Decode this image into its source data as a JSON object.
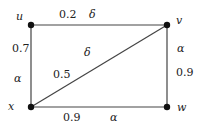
{
  "graph": {
    "nodes": [
      {
        "id": "u",
        "label": "u",
        "x": 31,
        "y": 25
      },
      {
        "id": "v",
        "label": "v",
        "x": 167,
        "y": 25
      },
      {
        "id": "x",
        "label": "x",
        "x": 31,
        "y": 107
      },
      {
        "id": "w",
        "label": "w",
        "x": 167,
        "y": 107
      }
    ],
    "edges": [
      {
        "from": "u",
        "to": "v",
        "weight": "0.2",
        "param": "δ"
      },
      {
        "from": "u",
        "to": "x",
        "weight": "0.7",
        "param": "α"
      },
      {
        "from": "v",
        "to": "w",
        "weight": "0.9",
        "param": "α"
      },
      {
        "from": "x",
        "to": "w",
        "weight": "0.9",
        "param": "α"
      },
      {
        "from": "x",
        "to": "v",
        "weight": "0.5",
        "param": "δ"
      }
    ]
  },
  "colors": {
    "edge": "#444444",
    "node": "#111111",
    "text": "#222222"
  }
}
